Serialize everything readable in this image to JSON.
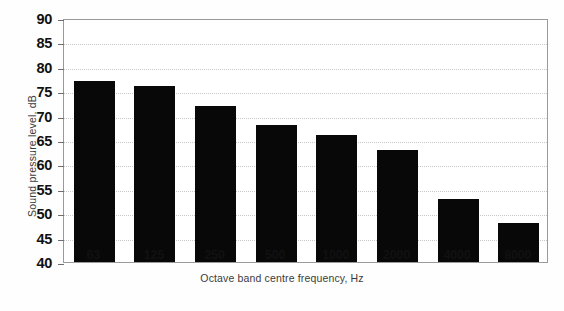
{
  "chart_data": {
    "type": "bar",
    "title": "",
    "xlabel": "Octave band centre frequency, Hz",
    "ylabel": "Sound pressure level, dB",
    "categories": [
      "63",
      "125",
      "250",
      "500",
      "1000",
      "2000",
      "4000",
      "8000"
    ],
    "values": [
      77,
      76,
      72,
      68,
      66,
      63,
      53,
      48
    ],
    "ylim": [
      40,
      90
    ],
    "ytick_labels": [
      "90",
      "85",
      "80",
      "75",
      "70",
      "65",
      "60",
      "55",
      "50",
      "45",
      "40"
    ],
    "ytick_values": [
      90,
      85,
      80,
      75,
      70,
      65,
      60,
      55,
      50,
      45,
      40
    ],
    "grid": "horizontal-dotted",
    "legend": "none",
    "bar_color": "#080808",
    "grid_color": "#c8c8c8",
    "axis_color": "#9a9a9a",
    "background": "#ffffff"
  },
  "figure": {
    "ghost_caption": ""
  }
}
